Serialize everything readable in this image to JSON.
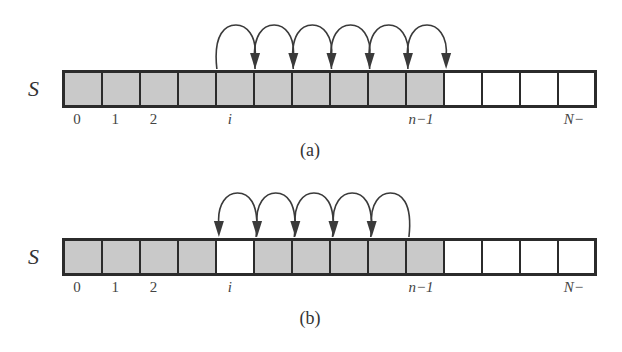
{
  "diagram": {
    "array_name": "S",
    "cell_count": 14,
    "colors": {
      "filled": "#c9c9c9",
      "empty": "#ffffff",
      "border": "#2b2b2b",
      "arrow": "#3a3a3a"
    },
    "index_labels": [
      {
        "cell": 0,
        "text": "0",
        "italic": false
      },
      {
        "cell": 1,
        "text": "1",
        "italic": false
      },
      {
        "cell": 2,
        "text": "2",
        "italic": false
      },
      {
        "cell": 4,
        "text": "i",
        "italic": true
      },
      {
        "cell": 9,
        "text": "n−1",
        "italic": true
      },
      {
        "cell": 13,
        "text": "N−",
        "italic": true
      }
    ],
    "panels": [
      {
        "caption": "(a)",
        "filled_cells": [
          0,
          1,
          2,
          3,
          4,
          5,
          6,
          7,
          8,
          9
        ],
        "arrows": [
          [
            4,
            5
          ],
          [
            5,
            6
          ],
          [
            6,
            7
          ],
          [
            7,
            8
          ],
          [
            8,
            9
          ],
          [
            9,
            10
          ]
        ],
        "description": "Shift elements right to insert at index i"
      },
      {
        "caption": "(b)",
        "filled_cells": [
          0,
          1,
          2,
          3,
          5,
          6,
          7,
          8,
          9
        ],
        "arrows": [
          [
            5,
            4
          ],
          [
            6,
            5
          ],
          [
            7,
            6
          ],
          [
            8,
            7
          ],
          [
            9,
            8
          ]
        ],
        "description": "Shift elements left to remove at index i"
      }
    ]
  }
}
